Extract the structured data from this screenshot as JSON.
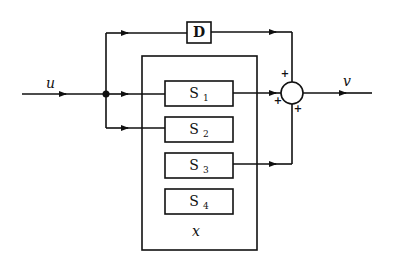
{
  "diagram": {
    "type": "block-diagram",
    "input_signal": "u",
    "output_signal": "v",
    "direct_block": {
      "label": "D"
    },
    "system": {
      "label": "x",
      "subsystems": [
        {
          "label": "S",
          "sub": "1"
        },
        {
          "label": "S",
          "sub": "2"
        },
        {
          "label": "S",
          "sub": "3"
        },
        {
          "label": "S",
          "sub": "4"
        }
      ]
    },
    "summing_junction": {
      "signs": [
        "+",
        "+",
        "+"
      ]
    }
  }
}
